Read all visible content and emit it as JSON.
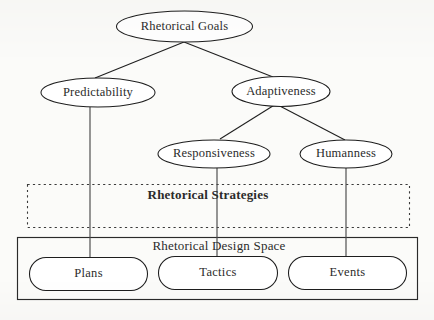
{
  "diagram": {
    "colors": {
      "background": "#fbfbf9",
      "stroke": "#1d1d1d",
      "text": "#2b2b2b",
      "dashed_stroke": "#3a3a3a"
    },
    "nodes": {
      "goals": "Rhetorical Goals",
      "predictability": "Predictability",
      "adaptiveness": "Adaptiveness",
      "responsiveness": "Responsiveness",
      "humanness": "Humanness"
    },
    "regions": {
      "strategies": "Rhetorical Strategies",
      "design_space": "Rhetorical Design Space"
    },
    "design_space_items": {
      "plans": "Plans",
      "tactics": "Tactics",
      "events": "Events"
    }
  }
}
